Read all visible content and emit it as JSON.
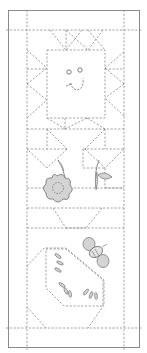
{
  "diagram": {
    "type": "quilt-pattern",
    "title": "",
    "colors": {
      "background": "#ffffff",
      "frame": "#8a8a8a",
      "stitch": "#8a8a8a",
      "applique_fill": "#d4d4d4",
      "applique_stroke": "#6e6e6e"
    },
    "blocks": [
      {
        "name": "sun-block",
        "motif": "sun face with radiating triangles"
      },
      {
        "name": "flower-block",
        "motif": "flower and leaves with triangle borders"
      },
      {
        "name": "bee-block",
        "motif": "bee over hexagon patch with seed stitches"
      }
    ]
  }
}
